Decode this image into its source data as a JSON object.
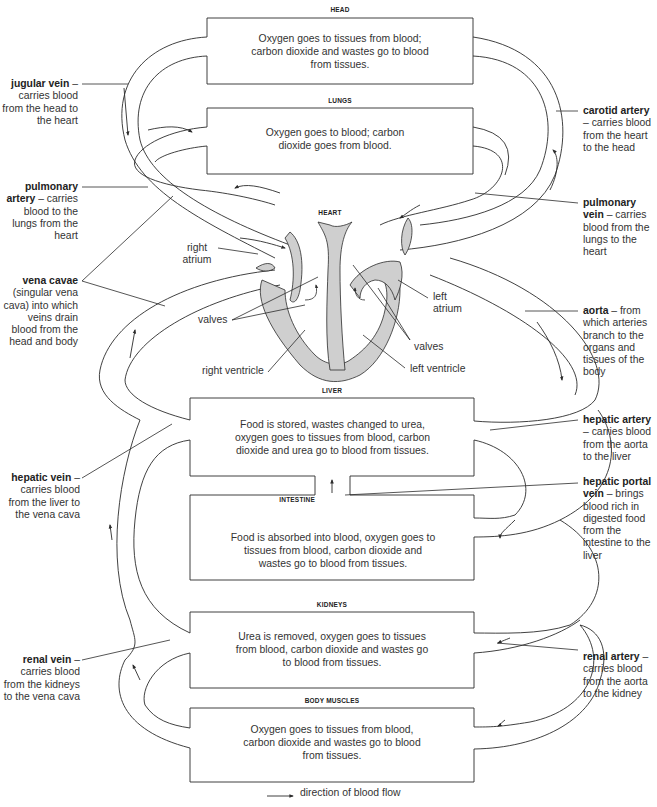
{
  "organs": {
    "head": {
      "title": "HEAD",
      "text": "Oxygen goes to tissues from blood; carbon dioxide and wastes go to blood from tissues."
    },
    "lungs": {
      "title": "LUNGS",
      "text": "Oxygen goes to blood; carbon dioxide goes from blood."
    },
    "heart": {
      "title": "HEART"
    },
    "liver": {
      "title": "LIVER",
      "text": "Food is stored, wastes changed to urea, oxygen goes to tissues from blood, carbon dioxide and urea go to blood from tissues."
    },
    "intestine": {
      "title": "INTESTINE",
      "text": "Food is absorbed into blood, oxygen goes to tissues from blood, carbon dioxide and wastes go to blood from tissues."
    },
    "kidneys": {
      "title": "KIDNEYS",
      "text": "Urea is removed, oxygen goes to tissues from blood, carbon dioxide and wastes go to blood from tissues."
    },
    "body_muscles": {
      "title": "BODY MUSCLES",
      "text": "Oxygen goes to tissues from blood, carbon dioxide and wastes go to blood from tissues."
    }
  },
  "vessels": {
    "jugular_vein": {
      "name": "jugular vein",
      "desc": "– carries blood from the head to the heart"
    },
    "pulmonary_artery": {
      "name": "pulmonary artery",
      "desc": "– carries blood to the lungs from the heart"
    },
    "vena_cavae": {
      "name": "vena cavae",
      "desc": "(singular vena cava) into which veins drain blood from the head and body"
    },
    "hepatic_vein": {
      "name": "hepatic vein",
      "desc": "– carries blood from the liver to the vena cava"
    },
    "renal_vein": {
      "name": "renal vein",
      "desc": "– carries blood from the kidneys to the vena cava"
    },
    "carotid_artery": {
      "name": "carotid artery",
      "desc": "– carries blood from the heart to the head"
    },
    "pulmonary_vein": {
      "name": "pulmonary vein",
      "desc": "– carries blood from the lungs to the heart"
    },
    "aorta": {
      "name": "aorta",
      "desc": "– from which arteries branch to the organs and tissues of the body"
    },
    "hepatic_artery": {
      "name": "hepatic artery",
      "desc": "– carries blood from the aorta to the liver"
    },
    "hepatic_portal_vein": {
      "name": "hepatic portal vein",
      "desc": "– brings blood rich in digested food from the intestine to the liver"
    },
    "renal_artery": {
      "name": "renal artery",
      "desc": "– carries blood from the aorta to the kidney"
    }
  },
  "heart_parts": {
    "right_atrium": "right atrium",
    "left_atrium": "left atrium",
    "valves_left": "valves",
    "valves_right": "valves",
    "right_ventricle": "right ventricle",
    "left_ventricle": "left ventricle"
  },
  "legend": {
    "arrow_icon": "arrow-right-icon",
    "text": "direction of blood flow"
  },
  "colors": {
    "line": "#2b2b2b",
    "heart_fill": "#cfcfcf",
    "text": "#333333",
    "background": "#ffffff"
  }
}
